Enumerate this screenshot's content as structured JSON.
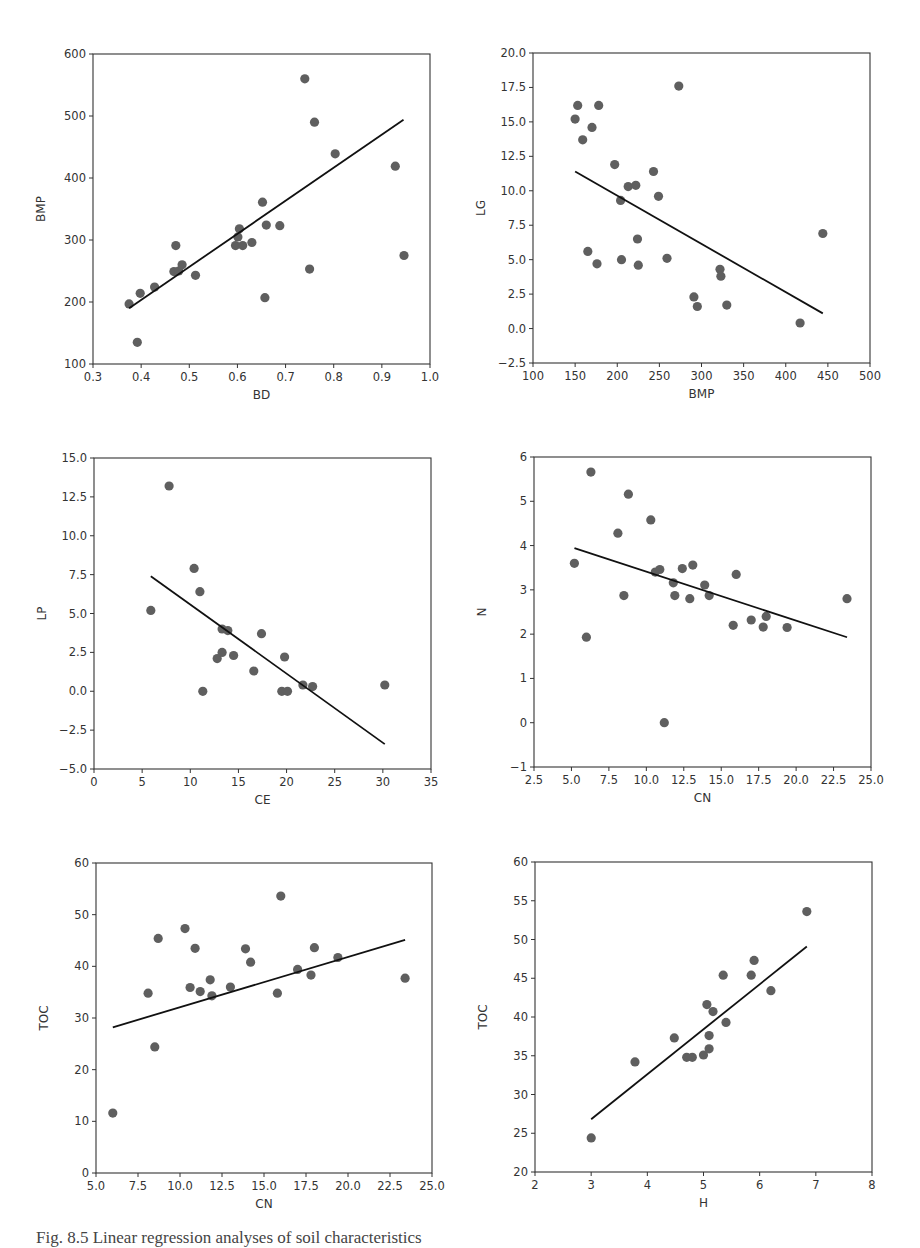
{
  "figure": {
    "caption": "Fig. 8.5 Linear regression analyses of soil characteristics"
  },
  "chart_data": [
    {
      "id": "bd-bmp",
      "type": "scatter",
      "title": "",
      "xlabel": "BD",
      "ylabel": "BMP",
      "xlim": [
        0.3,
        1.0
      ],
      "ylim": [
        100,
        600
      ],
      "xticks": [
        0.3,
        0.4,
        0.5,
        0.6,
        0.7,
        0.8,
        0.9,
        1.0
      ],
      "xtick_labels": [
        "0.3",
        "0.4",
        "0.5",
        "0.6",
        "0.7",
        "0.8",
        "0.9",
        "1.0"
      ],
      "yticks": [
        100,
        200,
        300,
        400,
        500,
        600
      ],
      "ytick_labels": [
        "100",
        "200",
        "300",
        "400",
        "500",
        "600"
      ],
      "grid": false,
      "frame": {
        "left": 93,
        "top": 54,
        "right": 430,
        "bottom": 364
      },
      "points": [
        [
          0.375,
          197
        ],
        [
          0.392,
          135
        ],
        [
          0.398,
          214
        ],
        [
          0.428,
          224
        ],
        [
          0.468,
          249
        ],
        [
          0.472,
          291
        ],
        [
          0.478,
          250
        ],
        [
          0.485,
          260
        ],
        [
          0.513,
          243
        ],
        [
          0.596,
          291
        ],
        [
          0.601,
          305
        ],
        [
          0.604,
          318
        ],
        [
          0.611,
          291
        ],
        [
          0.63,
          296
        ],
        [
          0.652,
          361
        ],
        [
          0.657,
          207
        ],
        [
          0.66,
          324
        ],
        [
          0.688,
          323
        ],
        [
          0.74,
          560
        ],
        [
          0.75,
          253
        ],
        [
          0.76,
          490
        ],
        [
          0.803,
          439
        ],
        [
          0.928,
          419
        ],
        [
          0.946,
          275
        ]
      ],
      "fit_line": [
        [
          0.375,
          190
        ],
        [
          0.945,
          494
        ]
      ]
    },
    {
      "id": "bmp-lg",
      "type": "scatter",
      "title": "",
      "xlabel": "BMP",
      "ylabel": "LG",
      "xlim": [
        100,
        500
      ],
      "ylim": [
        -2.5,
        20.0
      ],
      "xticks": [
        100,
        150,
        200,
        250,
        300,
        350,
        400,
        450,
        500
      ],
      "xtick_labels": [
        "100",
        "150",
        "200",
        "250",
        "300",
        "350",
        "400",
        "450",
        "500"
      ],
      "yticks": [
        -2.5,
        0.0,
        2.5,
        5.0,
        7.5,
        10.0,
        12.5,
        15.0,
        17.5,
        20.0
      ],
      "ytick_labels": [
        "−2.5",
        "0.0",
        "2.5",
        "5.0",
        "7.5",
        "10.0",
        "12.5",
        "15.0",
        "17.5",
        "20.0"
      ],
      "grid": false,
      "frame": {
        "left": 533,
        "top": 53,
        "right": 870,
        "bottom": 363
      },
      "points": [
        [
          150,
          15.2
        ],
        [
          153,
          16.2
        ],
        [
          159,
          13.7
        ],
        [
          165,
          5.6
        ],
        [
          170,
          14.6
        ],
        [
          176,
          4.7
        ],
        [
          178,
          16.2
        ],
        [
          197,
          11.9
        ],
        [
          204,
          9.3
        ],
        [
          205,
          5.0
        ],
        [
          213,
          10.3
        ],
        [
          222,
          10.4
        ],
        [
          224,
          6.5
        ],
        [
          225,
          4.6
        ],
        [
          243,
          11.4
        ],
        [
          249,
          9.6
        ],
        [
          259,
          5.1
        ],
        [
          273,
          17.6
        ],
        [
          291,
          2.3
        ],
        [
          295,
          1.6
        ],
        [
          322,
          4.3
        ],
        [
          323,
          3.8
        ],
        [
          330,
          1.7
        ],
        [
          417,
          0.4
        ],
        [
          444,
          6.9
        ]
      ],
      "fit_line": [
        [
          150,
          11.4
        ],
        [
          444,
          1.1
        ]
      ]
    },
    {
      "id": "ce-lp",
      "type": "scatter",
      "title": "",
      "xlabel": "CE",
      "ylabel": "LP",
      "xlim": [
        0,
        35
      ],
      "ylim": [
        -5.0,
        15.0
      ],
      "xticks": [
        0,
        5,
        10,
        15,
        20,
        25,
        30,
        35
      ],
      "xtick_labels": [
        "0",
        "5",
        "10",
        "15",
        "20",
        "25",
        "30",
        "35"
      ],
      "yticks": [
        -5.0,
        -2.5,
        0.0,
        2.5,
        5.0,
        7.5,
        10.0,
        12.5,
        15.0
      ],
      "ytick_labels": [
        "−5.0",
        "−2.5",
        "0.0",
        "2.5",
        "5.0",
        "7.5",
        "10.0",
        "12.5",
        "15.0"
      ],
      "grid": false,
      "frame": {
        "left": 94,
        "top": 458,
        "right": 431,
        "bottom": 769
      },
      "points": [
        [
          5.9,
          5.2
        ],
        [
          7.8,
          13.2
        ],
        [
          10.4,
          7.9
        ],
        [
          11.0,
          6.4
        ],
        [
          11.3,
          0.0
        ],
        [
          12.8,
          2.1
        ],
        [
          13.3,
          2.5
        ],
        [
          13.3,
          4.0
        ],
        [
          13.9,
          3.9
        ],
        [
          14.5,
          2.3
        ],
        [
          16.6,
          1.3
        ],
        [
          17.4,
          3.7
        ],
        [
          19.5,
          0.0
        ],
        [
          19.8,
          2.2
        ],
        [
          20.1,
          0.0
        ],
        [
          21.7,
          0.4
        ],
        [
          22.7,
          0.3
        ],
        [
          30.2,
          0.4
        ]
      ],
      "fit_line": [
        [
          5.9,
          7.4
        ],
        [
          30.2,
          -3.4
        ]
      ]
    },
    {
      "id": "cn-n",
      "type": "scatter",
      "title": "",
      "xlabel": "CN",
      "ylabel": "N",
      "xlim": [
        2.5,
        25.0
      ],
      "ylim": [
        -1,
        6
      ],
      "xticks": [
        2.5,
        5.0,
        7.5,
        10.0,
        12.5,
        15.0,
        17.5,
        20.0,
        22.5,
        25.0
      ],
      "xtick_labels": [
        "2.5",
        "5.0",
        "7.5",
        "10.0",
        "12.5",
        "15.0",
        "17.5",
        "20.0",
        "22.5",
        "25.0"
      ],
      "yticks": [
        -1,
        0,
        1,
        2,
        3,
        4,
        5,
        6
      ],
      "ytick_labels": [
        "−1",
        "0",
        "1",
        "2",
        "3",
        "4",
        "5",
        "6"
      ],
      "grid": false,
      "frame": {
        "left": 534,
        "top": 457,
        "right": 871,
        "bottom": 767
      },
      "points": [
        [
          5.2,
          3.6
        ],
        [
          6.0,
          1.93
        ],
        [
          6.3,
          5.66
        ],
        [
          8.1,
          4.28
        ],
        [
          8.5,
          2.87
        ],
        [
          8.8,
          5.16
        ],
        [
          10.3,
          4.58
        ],
        [
          10.6,
          3.4
        ],
        [
          10.9,
          3.46
        ],
        [
          11.2,
          0.0
        ],
        [
          11.8,
          3.16
        ],
        [
          11.9,
          2.87
        ],
        [
          12.4,
          3.48
        ],
        [
          12.9,
          2.8
        ],
        [
          13.1,
          3.56
        ],
        [
          13.9,
          3.11
        ],
        [
          14.2,
          2.87
        ],
        [
          15.8,
          2.2
        ],
        [
          16.0,
          3.35
        ],
        [
          17.0,
          2.32
        ],
        [
          17.8,
          2.16
        ],
        [
          18.0,
          2.4
        ],
        [
          19.4,
          2.15
        ],
        [
          23.4,
          2.8
        ]
      ],
      "fit_line": [
        [
          5.2,
          3.94
        ],
        [
          23.4,
          1.93
        ]
      ]
    },
    {
      "id": "cn-toc",
      "type": "scatter",
      "title": "",
      "xlabel": "CN",
      "ylabel": "TOC",
      "xlim": [
        5.0,
        25.0
      ],
      "ylim": [
        0,
        60
      ],
      "xticks": [
        5.0,
        7.5,
        10.0,
        12.5,
        15.0,
        17.5,
        20.0,
        22.5,
        25.0
      ],
      "xtick_labels": [
        "5.0",
        "7.5",
        "10.0",
        "12.5",
        "15.0",
        "17.5",
        "20.0",
        "22.5",
        "25.0"
      ],
      "yticks": [
        0,
        10,
        20,
        30,
        40,
        50,
        60
      ],
      "ytick_labels": [
        "0",
        "10",
        "20",
        "30",
        "40",
        "50",
        "60"
      ],
      "grid": false,
      "frame": {
        "left": 96,
        "top": 863,
        "right": 432,
        "bottom": 1173
      },
      "points": [
        [
          6.0,
          11.6
        ],
        [
          8.1,
          34.8
        ],
        [
          8.5,
          24.4
        ],
        [
          8.7,
          45.4
        ],
        [
          10.3,
          47.3
        ],
        [
          10.6,
          35.9
        ],
        [
          10.9,
          43.5
        ],
        [
          11.2,
          35.1
        ],
        [
          11.8,
          37.4
        ],
        [
          11.9,
          34.3
        ],
        [
          13.0,
          36.0
        ],
        [
          13.9,
          43.4
        ],
        [
          14.2,
          40.8
        ],
        [
          15.8,
          34.8
        ],
        [
          16.0,
          53.6
        ],
        [
          17.0,
          39.4
        ],
        [
          17.8,
          38.3
        ],
        [
          18.0,
          43.6
        ],
        [
          19.4,
          41.7
        ],
        [
          23.4,
          37.7
        ]
      ],
      "fit_line": [
        [
          6.0,
          28.2
        ],
        [
          23.4,
          45.1
        ]
      ]
    },
    {
      "id": "h-toc",
      "type": "scatter",
      "title": "",
      "xlabel": "H",
      "ylabel": "TOC",
      "xlim": [
        2,
        8
      ],
      "ylim": [
        20,
        60
      ],
      "xticks": [
        2,
        3,
        4,
        5,
        6,
        7,
        8
      ],
      "xtick_labels": [
        "2",
        "3",
        "4",
        "5",
        "6",
        "7",
        "8"
      ],
      "yticks": [
        20,
        25,
        30,
        35,
        40,
        45,
        50,
        55,
        60
      ],
      "ytick_labels": [
        "20",
        "25",
        "30",
        "35",
        "40",
        "45",
        "50",
        "55",
        "60"
      ],
      "grid": false,
      "frame": {
        "left": 535,
        "top": 862,
        "right": 872,
        "bottom": 1172
      },
      "points": [
        [
          3.0,
          24.4
        ],
        [
          3.78,
          34.2
        ],
        [
          4.48,
          37.3
        ],
        [
          4.7,
          34.8
        ],
        [
          4.8,
          34.8
        ],
        [
          5.0,
          35.1
        ],
        [
          5.06,
          41.6
        ],
        [
          5.1,
          37.6
        ],
        [
          5.1,
          35.9
        ],
        [
          5.17,
          40.7
        ],
        [
          5.35,
          45.4
        ],
        [
          5.4,
          39.3
        ],
        [
          5.85,
          45.4
        ],
        [
          5.9,
          47.3
        ],
        [
          6.2,
          43.4
        ],
        [
          6.84,
          53.6
        ]
      ],
      "fit_line": [
        [
          3.0,
          26.8
        ],
        [
          6.84,
          49.1
        ]
      ]
    }
  ],
  "style": {
    "point_color": "#5f5f5f",
    "line_color": "#111111",
    "axis_color": "#333333",
    "text_color": "#333333"
  }
}
